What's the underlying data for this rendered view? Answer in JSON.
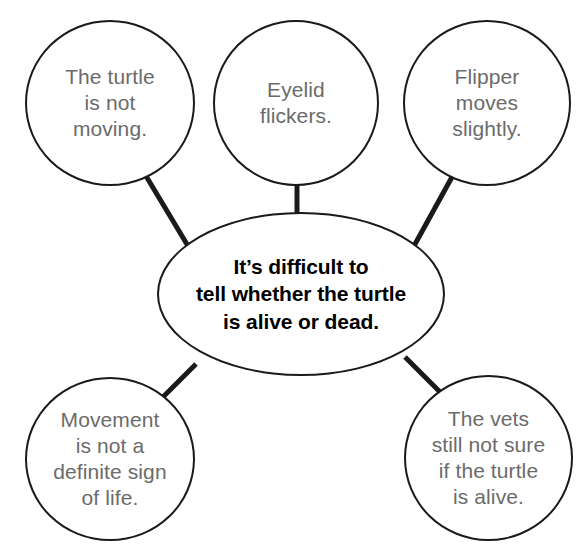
{
  "diagram": {
    "type": "concept-map",
    "colors": {
      "outline": "#1a1a1a",
      "satellite_text": "#6b6b6b",
      "center_text": "#000000",
      "connector": "#1a1a1a",
      "background": "#ffffff"
    },
    "center": {
      "id": "center-claim",
      "shape": "ellipse",
      "text": "It’s difficult to\ntell whether the turtle\nis alive or dead.",
      "emphasis": "bold"
    },
    "satellites": [
      {
        "id": "turtle-not-moving",
        "shape": "circle",
        "position": "top-left",
        "text": "The turtle\nis not\nmoving."
      },
      {
        "id": "eyelid-flickers",
        "shape": "circle",
        "position": "top-center",
        "text": "Eyelid\nflickers."
      },
      {
        "id": "flipper-moves",
        "shape": "circle",
        "position": "top-right",
        "text": "Flipper\nmoves\nslightly."
      },
      {
        "id": "movement-not-sign",
        "shape": "circle",
        "position": "bottom-left",
        "text": "Movement\nis not a\ndefinite sign\nof life."
      },
      {
        "id": "vets-not-sure",
        "shape": "circle",
        "position": "bottom-right",
        "text": "The vets\nstill not sure\nif the turtle\nis alive."
      }
    ],
    "connectors": [
      {
        "id": "connector-turtle-not-moving",
        "from": "turtle-not-moving",
        "to": "center-claim"
      },
      {
        "id": "connector-eyelid-flickers",
        "from": "eyelid-flickers",
        "to": "center-claim"
      },
      {
        "id": "connector-flipper-moves",
        "from": "flipper-moves",
        "to": "center-claim"
      },
      {
        "id": "connector-movement-not-sign",
        "from": "movement-not-sign",
        "to": "center-claim"
      },
      {
        "id": "connector-vets-not-sure",
        "from": "vets-not-sure",
        "to": "center-claim"
      }
    ]
  }
}
